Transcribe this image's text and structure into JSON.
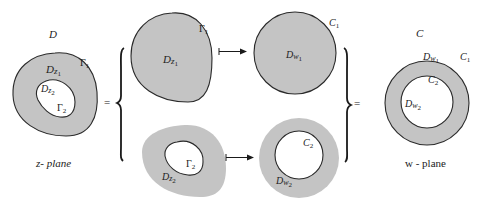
{
  "colors": {
    "fill": "#c4c4c4",
    "stroke": "#2a2a2a",
    "background": "#ffffff",
    "text": "#222222"
  },
  "left_domain": {
    "title": "D",
    "outer_region_label": "D",
    "outer_region_sub": "z",
    "outer_region_subsub": "1",
    "outer_boundary": "Γ",
    "outer_boundary_sub": "1",
    "inner_region_label": "D",
    "inner_region_sub": "z",
    "inner_region_subsub": "2",
    "inner_boundary": "Γ",
    "inner_boundary_sub": "2",
    "plane_label": "z- plane"
  },
  "equals_left": "=",
  "equals_right": "=",
  "top_row": {
    "source_region_label": "D",
    "source_region_sub": "z",
    "source_region_subsub": "1",
    "source_boundary": "Γ",
    "source_boundary_sub": "1",
    "arrow": "maps-to",
    "target_region_label": "D",
    "target_region_sub": "w",
    "target_region_subsub": "1",
    "target_boundary": "C",
    "target_boundary_sub": "1"
  },
  "bottom_row": {
    "source_region_label": "D",
    "source_region_sub": "z",
    "source_region_subsub": "2",
    "source_boundary": "Γ",
    "source_boundary_sub": "2",
    "arrow": "maps-to",
    "target_region_label": "D",
    "target_region_sub": "w",
    "target_region_subsub": "2",
    "target_boundary": "C",
    "target_boundary_sub": "2"
  },
  "right_domain": {
    "title": "C",
    "outer_boundary": "C",
    "outer_boundary_sub": "1",
    "outer_region_label": "D",
    "outer_region_sub": "w",
    "outer_region_subsub": "1",
    "inner_boundary": "C",
    "inner_boundary_sub": "2",
    "inner_region_label": "D",
    "inner_region_sub": "w",
    "inner_region_subsub": "2",
    "plane_label": "w - plane"
  }
}
